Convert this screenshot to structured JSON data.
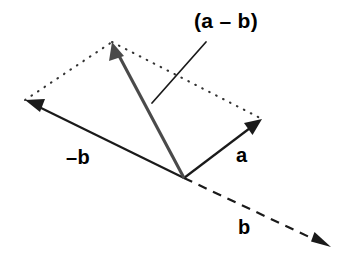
{
  "diagram": {
    "background_color": "#ffffff",
    "width": 349,
    "height": 271,
    "origin": {
      "x": 184,
      "y": 178
    },
    "labels": {
      "resultant": "(a – b)",
      "negative_b": "–b",
      "a": "a",
      "b": "b"
    },
    "colors": {
      "stroke_black": "#1a1a1a",
      "stroke_gray": "#4a4a4a",
      "dotted_gray": "#333333",
      "text": "#000000"
    },
    "vectors": [
      {
        "name": "a",
        "label": "a",
        "style": "solid",
        "color": "#1a1a1a",
        "arrowhead": true,
        "from": {
          "x": 184,
          "y": 178
        },
        "to": {
          "x": 262,
          "y": 119
        }
      },
      {
        "name": "b",
        "label": "b",
        "style": "dashed",
        "color": "#1a1a1a",
        "arrowhead": true,
        "from": {
          "x": 184,
          "y": 178
        },
        "to": {
          "x": 331,
          "y": 247
        }
      },
      {
        "name": "negative-b",
        "label": "–b",
        "style": "solid",
        "color": "#1a1a1a",
        "arrowhead": true,
        "from": {
          "x": 184,
          "y": 178
        },
        "to": {
          "x": 25,
          "y": 100
        }
      },
      {
        "name": "a-minus-b",
        "label": "(a – b)",
        "style": "solid",
        "color": "#4a4a4a",
        "arrowhead": true,
        "from": {
          "x": 184,
          "y": 178
        },
        "to": {
          "x": 112,
          "y": 42
        }
      }
    ],
    "construction_lines": [
      {
        "name": "dotted-edge-left",
        "style": "dotted",
        "from": {
          "x": 25,
          "y": 100
        },
        "to": {
          "x": 112,
          "y": 42
        }
      },
      {
        "name": "dotted-edge-right",
        "style": "dotted",
        "from": {
          "x": 112,
          "y": 42
        },
        "to": {
          "x": 262,
          "y": 119
        }
      }
    ],
    "leader_line": {
      "name": "leader-line-a-minus-b",
      "style": "solid",
      "from": {
        "x": 206,
        "y": 42
      },
      "to": {
        "x": 152,
        "y": 103
      }
    }
  }
}
